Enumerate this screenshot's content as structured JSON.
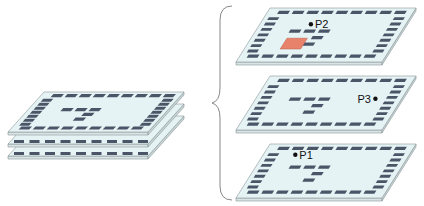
{
  "diagram": {
    "colors": {
      "board_top": "#e6f3f4",
      "board_edge": "#c9d6d8",
      "board_side": "#d8e4e6",
      "outline": "#8a9597",
      "pad": "#4a5568",
      "highlight_pad": "#e8826b",
      "brace": "#888888",
      "point": "#111111"
    },
    "left_stack": {
      "layer_count": 3
    },
    "right_layers": [
      {
        "id": "layer-top",
        "point_label": "P2",
        "has_highlight": true
      },
      {
        "id": "layer-middle",
        "point_label": "P3",
        "has_highlight": false
      },
      {
        "id": "layer-bottom",
        "point_label": "P1",
        "has_highlight": false
      }
    ],
    "labels": {
      "p1": "P1",
      "p2": "P2",
      "p3": "P3"
    }
  }
}
